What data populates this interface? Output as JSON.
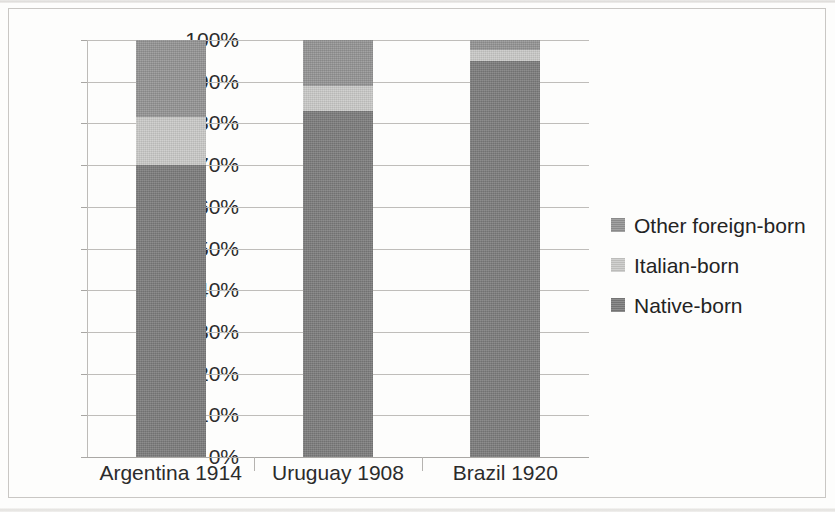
{
  "chart_data": {
    "type": "bar",
    "subtype": "stacked-100-percent",
    "title": "",
    "subtitle": "",
    "xlabel": "",
    "ylabel": "",
    "categories": [
      "Argentina 1914",
      "Uruguay 1908",
      "Brazil 1920"
    ],
    "series": [
      {
        "name": "Native-born",
        "color": "#7c7c7c",
        "values": [
          70.0,
          83.0,
          95.0
        ]
      },
      {
        "name": "Italian-born",
        "color": "#cacac8",
        "values": [
          11.5,
          6.0,
          2.5
        ]
      },
      {
        "name": "Other foreign-born",
        "color": "#949494",
        "values": [
          18.5,
          11.0,
          2.5
        ]
      }
    ],
    "stack_order_bottom_to_top": [
      "Native-born",
      "Italian-born",
      "Other foreign-born"
    ],
    "ylim": [
      0,
      100
    ],
    "y_tick_labels": [
      "100%",
      "90%",
      "80%",
      "70%",
      "60%",
      "50%",
      "40%",
      "30%",
      "20%",
      "10%",
      "0%"
    ],
    "y_tick_values": [
      100,
      90,
      80,
      70,
      60,
      50,
      40,
      30,
      20,
      10,
      0
    ],
    "grid": true,
    "grid_axis": "y",
    "legend_position": "right",
    "legend_entries": [
      "Other foreign-born",
      "Italian-born",
      "Native-born"
    ]
  },
  "colors": {
    "other_foreign_born": "#949494",
    "italian_born": "#cacac8",
    "native_born": "#7c7c7c",
    "gridline": "#bfbdba",
    "axis": "#aaa8a5",
    "text": "#2b2b2b",
    "frame": "#c9c7c4",
    "background": "#fdfdfc"
  }
}
